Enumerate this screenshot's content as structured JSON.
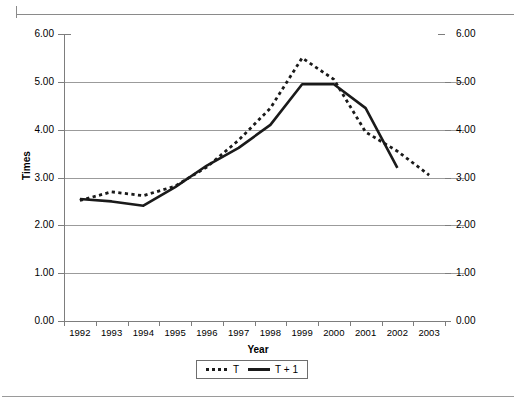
{
  "chart_data": {
    "type": "line",
    "title": "",
    "xlabel": "Year",
    "ylabel": "Times",
    "categories": [
      "1992",
      "1993",
      "1994",
      "1995",
      "1996",
      "1997",
      "1998",
      "1999",
      "2000",
      "2001",
      "2002",
      "2003"
    ],
    "ylim": [
      0,
      6
    ],
    "y_ticks": [
      "0.00",
      "1.00",
      "2.00",
      "3.00",
      "4.00",
      "5.00",
      "6.00"
    ],
    "y_tick_values": [
      0,
      1,
      2,
      3,
      4,
      5,
      6
    ],
    "y_axis_right_ticks": [
      "0.00",
      "1.00",
      "2.00",
      "3.00",
      "4.00",
      "5.00",
      "6.00"
    ],
    "dual_axis": true,
    "grid": true,
    "legend_position": "bottom",
    "series": [
      {
        "name": "T",
        "style": "dotted",
        "color": "#1a1a1a",
        "values": [
          2.52,
          2.7,
          2.62,
          2.82,
          3.22,
          3.78,
          4.45,
          5.5,
          5.05,
          3.95,
          3.55,
          3.05
        ]
      },
      {
        "name": "T + 1",
        "style": "solid",
        "color": "#1a1a1a",
        "values": [
          2.55,
          2.5,
          2.41,
          2.8,
          3.25,
          3.62,
          4.1,
          4.95,
          4.95,
          4.45,
          3.2,
          null
        ]
      }
    ]
  },
  "axes": {
    "y_title": "Times",
    "x_title": "Year"
  },
  "legend": {
    "items": [
      {
        "label": "T",
        "icon": "dotted-line-swatch"
      },
      {
        "label": "T + 1",
        "icon": "solid-line-swatch"
      }
    ]
  },
  "colors": {
    "ink": "#1a1a1a",
    "grid": "#9b9b9b",
    "axis": "#7d7d7d",
    "page_rule": "#8a8a8a",
    "background": "#ffffff"
  }
}
